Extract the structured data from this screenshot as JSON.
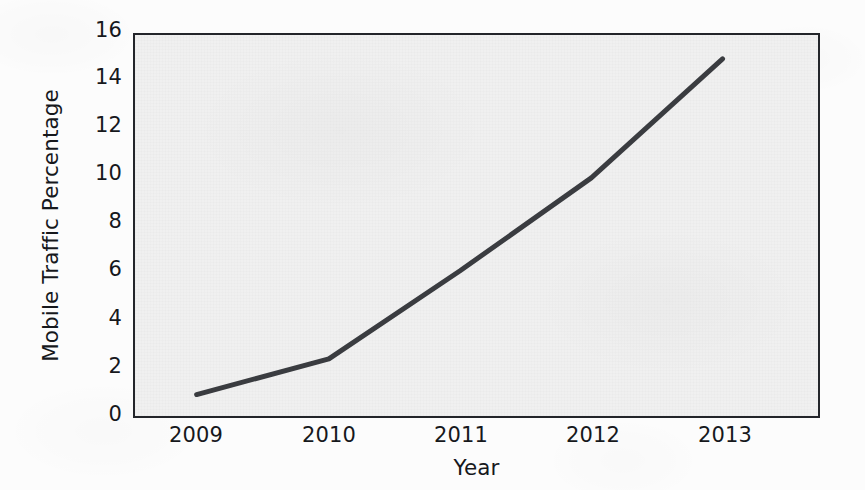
{
  "chart_data": {
    "type": "line",
    "title": "",
    "subtitle": "",
    "xlabel": "Year",
    "ylabel": "Mobile Traffic Percentage",
    "x": [
      2009,
      2010,
      2011,
      2012,
      2013
    ],
    "xtick_labels": [
      "2009",
      "2010",
      "2011",
      "2012",
      "2013"
    ],
    "ytick_labels": [
      "0",
      "2",
      "4",
      "6",
      "8",
      "10",
      "12",
      "14",
      "16"
    ],
    "yticks": [
      0,
      2,
      4,
      6,
      8,
      10,
      12,
      14,
      16
    ],
    "values": [
      0.9,
      2.4,
      6.1,
      10.0,
      15.0
    ],
    "series": [
      {
        "name": "Mobile Traffic Percentage",
        "values": [
          0.9,
          2.4,
          6.1,
          10.0,
          15.0
        ]
      }
    ],
    "xlim": [
      2008.6,
      2013.4
    ],
    "ylim": [
      0,
      16
    ],
    "grid": false,
    "legend": false,
    "legend_position": "none",
    "annotations": [],
    "line_color": "#3a3c40",
    "line_width": 5,
    "plot_background": "#f0f0f0",
    "figure_background": "#fcfcfc",
    "axis_color": "#23252a"
  }
}
